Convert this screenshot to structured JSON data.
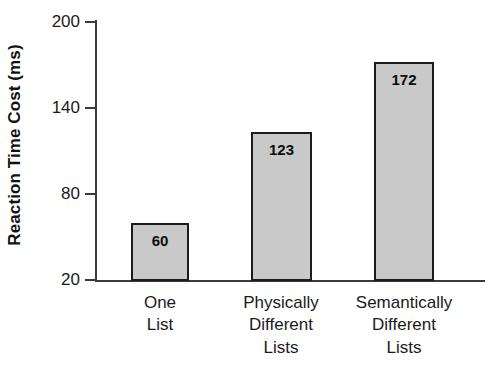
{
  "chart_data": {
    "type": "bar",
    "title": "",
    "xlabel": "",
    "ylabel": "Reaction Time Cost (ms)",
    "categories": [
      "One List",
      "Physically Different Lists",
      "Semantically Different Lists"
    ],
    "category_lines": [
      [
        "One",
        "List"
      ],
      [
        "Physically",
        "Different",
        "Lists"
      ],
      [
        "Semantically",
        "Different",
        "Lists"
      ]
    ],
    "values": [
      60,
      123,
      172
    ],
    "value_labels": [
      "60",
      "123",
      "172"
    ],
    "ylim": [
      20,
      200
    ],
    "yticks": [
      20,
      80,
      140,
      200
    ],
    "ytick_labels": [
      "20",
      "80",
      "140",
      "200"
    ],
    "grid": false,
    "legend": null,
    "bar_fill_color": "#c9c9c9",
    "bar_edge_color": "#1c1c1c",
    "axis_color": "#3a3a3a",
    "background_color": "#ffffff"
  }
}
